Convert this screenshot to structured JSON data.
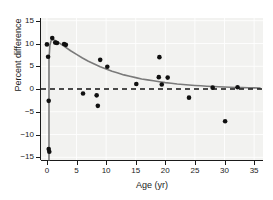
{
  "chart_data": {
    "type": "scatter",
    "title": "",
    "xlabel": "Age (yr)",
    "ylabel": "Percent difference",
    "xlim": [
      -1.0,
      36.5
    ],
    "ylim": [
      -15.6,
      15.6
    ],
    "xticks": [
      0,
      5,
      10,
      15,
      20,
      25,
      30,
      35
    ],
    "xticklabels": [
      "0",
      "5",
      "10",
      "15",
      "20",
      "25",
      "30",
      "35"
    ],
    "yticks": [
      15,
      10,
      5,
      0,
      -5,
      -10,
      -15
    ],
    "yticklabels": [
      "15",
      "10",
      "5",
      "0",
      "−5",
      "−10",
      "−15"
    ],
    "grid": true,
    "legend": false,
    "background_color": "#f2f2f0",
    "grid_color": "#ffffff",
    "point_color": "#101010",
    "point_marker": "circle",
    "point_size": 4.6,
    "series": [
      {
        "name": "Percent difference vs age",
        "points": [
          [
            0.0,
            9.8
          ],
          [
            0.2,
            7.1
          ],
          [
            0.3,
            -2.6
          ],
          [
            0.3,
            -13.2
          ],
          [
            0.4,
            -13.8
          ],
          [
            0.9,
            11.2
          ],
          [
            1.4,
            10.2
          ],
          [
            1.7,
            10.1
          ],
          [
            2.9,
            9.9
          ],
          [
            3.2,
            9.7
          ],
          [
            6.1,
            -1.0
          ],
          [
            8.4,
            -1.4
          ],
          [
            8.6,
            -3.7
          ],
          [
            9.0,
            6.4
          ],
          [
            10.2,
            4.9
          ],
          [
            15.1,
            1.1
          ],
          [
            18.9,
            2.6
          ],
          [
            19.0,
            7.0
          ],
          [
            19.4,
            1.0
          ],
          [
            20.4,
            2.5
          ],
          [
            24.0,
            -1.9
          ],
          [
            28.0,
            0.3
          ],
          [
            30.1,
            -7.1
          ],
          [
            32.2,
            0.4
          ]
        ]
      }
    ],
    "fit_curve": {
      "name": "exponential decay fit",
      "color": "#7a7a7a",
      "line_width": 1.6,
      "points": [
        [
          0.35,
          -15.6
        ],
        [
          0.35,
          6.5
        ],
        [
          0.5,
          9.6
        ],
        [
          0.7,
          10.6
        ],
        [
          1.0,
          10.9
        ],
        [
          1.5,
          10.6
        ],
        [
          2.0,
          10.2
        ],
        [
          3.0,
          9.3
        ],
        [
          4.0,
          8.4
        ],
        [
          5.0,
          7.6
        ],
        [
          6.0,
          6.8
        ],
        [
          7.0,
          6.1
        ],
        [
          8.0,
          5.5
        ],
        [
          9.0,
          4.9
        ],
        [
          10.0,
          4.4
        ],
        [
          11.0,
          3.9
        ],
        [
          12.0,
          3.5
        ],
        [
          13.0,
          3.1
        ],
        [
          14.0,
          2.8
        ],
        [
          15.0,
          2.5
        ],
        [
          16.0,
          2.2
        ],
        [
          17.0,
          2.0
        ],
        [
          18.0,
          1.8
        ],
        [
          19.0,
          1.6
        ],
        [
          20.0,
          1.4
        ],
        [
          21.0,
          1.25
        ],
        [
          22.0,
          1.1
        ],
        [
          23.0,
          1.0
        ],
        [
          24.0,
          0.88
        ],
        [
          25.0,
          0.78
        ],
        [
          26.0,
          0.7
        ],
        [
          27.0,
          0.62
        ],
        [
          28.0,
          0.55
        ],
        [
          29.0,
          0.48
        ],
        [
          30.0,
          0.43
        ],
        [
          31.0,
          0.38
        ],
        [
          32.0,
          0.34
        ],
        [
          33.0,
          0.3
        ],
        [
          34.0,
          0.27
        ],
        [
          35.0,
          0.24
        ],
        [
          36.0,
          0.21
        ]
      ]
    },
    "reference_line": {
      "name": "zero-reference-line",
      "y": 0,
      "style": "dashed",
      "color": "#101010",
      "line_width": 1.6
    }
  }
}
